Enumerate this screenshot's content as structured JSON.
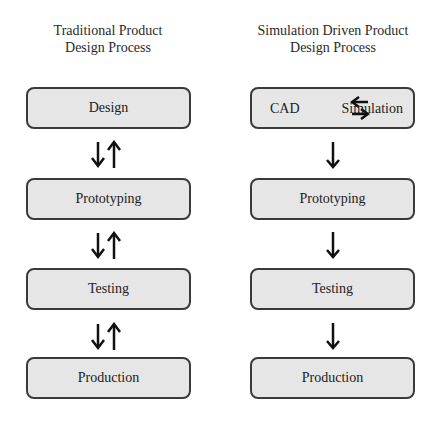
{
  "left": {
    "title_line1": "Traditional Product",
    "title_line2": "Design Process",
    "steps": [
      "Design",
      "Prototyping",
      "Testing",
      "Production"
    ],
    "connector": "bidirectional"
  },
  "right": {
    "title_line1": "Simulation Driven Product",
    "title_line2": "Design Process",
    "first_step": {
      "left_label": "CAD",
      "right_label": "Simulation",
      "connector": "bidirectional"
    },
    "steps": [
      "Prototyping",
      "Testing",
      "Production"
    ],
    "connector": "down"
  },
  "colors": {
    "box_fill": "#e6e6e6",
    "box_border": "#3a3a3a",
    "arrow": "#111111"
  }
}
